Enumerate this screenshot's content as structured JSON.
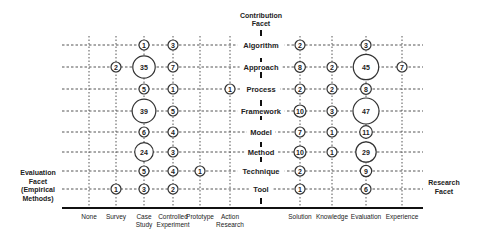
{
  "chart_data": {
    "type": "bubble-matrix",
    "title": "",
    "y_facet_title": [
      "Contribution",
      "Facet"
    ],
    "left_facet_title": [
      "Evaluation",
      "Facet",
      "(Empirical",
      "Methods)"
    ],
    "right_facet_title": [
      "Research",
      "Facet"
    ],
    "rows": [
      "Algorithm",
      "Approach",
      "Process",
      "Framework",
      "Model",
      "Method",
      "Technique",
      "Tool"
    ],
    "left_columns": [
      {
        "label": [
          "None"
        ]
      },
      {
        "label": [
          "Survey"
        ]
      },
      {
        "label": [
          "Case",
          "Study"
        ]
      },
      {
        "label": [
          "Controlled",
          "Experiment"
        ]
      },
      {
        "label": [
          "Prototype"
        ]
      },
      {
        "label": [
          "Action",
          "Research"
        ]
      }
    ],
    "right_columns": [
      {
        "label": [
          "Solution"
        ]
      },
      {
        "label": [
          "Knowledge"
        ]
      },
      {
        "label": [
          "Evaluation"
        ]
      },
      {
        "label": [
          "Experience"
        ]
      }
    ],
    "left_values": [
      [
        0,
        0,
        1,
        3,
        0,
        0
      ],
      [
        0,
        2,
        35,
        7,
        0,
        0
      ],
      [
        0,
        0,
        5,
        1,
        0,
        1
      ],
      [
        0,
        0,
        39,
        5,
        0,
        0
      ],
      [
        0,
        0,
        6,
        4,
        0,
        0
      ],
      [
        0,
        0,
        24,
        3,
        0,
        0
      ],
      [
        0,
        0,
        5,
        4,
        1,
        0
      ],
      [
        0,
        1,
        3,
        2,
        0,
        0
      ]
    ],
    "right_values": [
      [
        2,
        0,
        3,
        0
      ],
      [
        8,
        2,
        45,
        7
      ],
      [
        2,
        2,
        8,
        0
      ],
      [
        10,
        3,
        47,
        0
      ],
      [
        7,
        1,
        11,
        0
      ],
      [
        10,
        1,
        29,
        0
      ],
      [
        2,
        0,
        9,
        0
      ],
      [
        1,
        0,
        6,
        0
      ]
    ]
  }
}
